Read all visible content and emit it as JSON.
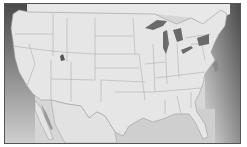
{
  "map": {
    "title": "",
    "region": "contiguous United States",
    "style": "grayscale",
    "colors": {
      "land": "#e4e4e4",
      "borders": "#b0b0b0",
      "water_light": "#c8c8c8",
      "water_dark": "#5a5a5a",
      "lakes": "#666666",
      "frame": "#555555",
      "background": "#ffffff"
    },
    "highlighted_features": [
      "great-lakes",
      "great-salt-lake",
      "gulf-of-california"
    ]
  }
}
